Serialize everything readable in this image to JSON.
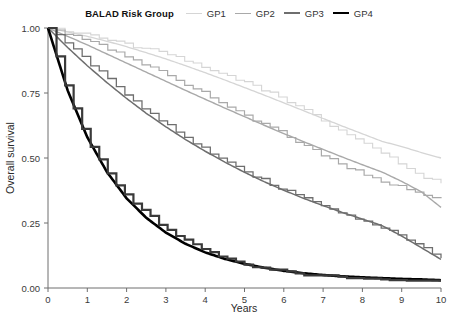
{
  "legend": {
    "title": "BALAD Risk Group",
    "entries": [
      {
        "label": "GP1",
        "color": "#d5d5d5",
        "width": 1.6
      },
      {
        "label": "GP2",
        "color": "#a9a9a9",
        "width": 1.8
      },
      {
        "label": "GP3",
        "color": "#6e6e6e",
        "width": 2.0
      },
      {
        "label": "GP4",
        "color": "#000000",
        "width": 2.8
      }
    ]
  },
  "axes": {
    "x_title": "Years",
    "y_title": "Overall survival",
    "x_ticks": [
      "0",
      "1",
      "2",
      "3",
      "4",
      "5",
      "6",
      "7",
      "8",
      "9",
      "10"
    ],
    "y_ticks": [
      "0.00",
      "0.25",
      "0.50",
      "0.75",
      "1.00"
    ]
  },
  "chart_data": {
    "type": "line",
    "title": "",
    "subtitle": "",
    "xlabel": "Years",
    "ylabel": "Overall survival",
    "xlim": [
      0,
      10
    ],
    "ylim": [
      0,
      1
    ],
    "xticks": [
      0,
      1,
      2,
      3,
      4,
      5,
      6,
      7,
      8,
      9,
      10
    ],
    "yticks": [
      0.0,
      0.25,
      0.5,
      0.75,
      1.0
    ],
    "grid": false,
    "legend_position": "top-center",
    "legend_title": "BALAD Risk Group",
    "x": [
      0,
      0.5,
      1,
      1.5,
      2,
      2.5,
      3,
      3.5,
      4,
      4.5,
      5,
      5.5,
      6,
      6.5,
      7,
      7.5,
      8,
      8.5,
      9,
      9.5,
      10
    ],
    "series": [
      {
        "name": "GP1",
        "kind": "smooth-fitted",
        "color": "#d5d5d5",
        "values": [
          1.0,
          0.985,
          0.968,
          0.949,
          0.928,
          0.905,
          0.881,
          0.855,
          0.828,
          0.8,
          0.771,
          0.742,
          0.712,
          0.682,
          0.652,
          0.622,
          0.593,
          0.564,
          0.544,
          0.521,
          0.5
        ]
      },
      {
        "name": "GP1",
        "kind": "kaplan-meier-step",
        "color": "#d5d5d5",
        "values": [
          1.0,
          0.988,
          0.975,
          0.958,
          0.935,
          0.918,
          0.9,
          0.872,
          0.84,
          0.82,
          0.79,
          0.76,
          0.72,
          0.69,
          0.64,
          0.6,
          0.56,
          0.52,
          0.47,
          0.43,
          0.4
        ]
      },
      {
        "name": "GP2",
        "kind": "smooth-fitted",
        "color": "#a9a9a9",
        "values": [
          1.0,
          0.968,
          0.935,
          0.9,
          0.865,
          0.83,
          0.795,
          0.76,
          0.726,
          0.692,
          0.659,
          0.626,
          0.594,
          0.563,
          0.533,
          0.503,
          0.474,
          0.446,
          0.41,
          0.37,
          0.31
        ]
      },
      {
        "name": "GP2",
        "kind": "kaplan-meier-step",
        "color": "#a9a9a9",
        "values": [
          1.0,
          0.975,
          0.95,
          0.92,
          0.89,
          0.855,
          0.82,
          0.78,
          0.745,
          0.705,
          0.665,
          0.625,
          0.59,
          0.55,
          0.51,
          0.47,
          0.44,
          0.41,
          0.385,
          0.36,
          0.34
        ]
      },
      {
        "name": "GP3",
        "kind": "smooth-fitted",
        "color": "#6e6e6e",
        "values": [
          1.0,
          0.925,
          0.855,
          0.79,
          0.729,
          0.672,
          0.62,
          0.571,
          0.526,
          0.484,
          0.445,
          0.409,
          0.376,
          0.345,
          0.317,
          0.29,
          0.265,
          0.24,
          0.2,
          0.155,
          0.11
        ]
      },
      {
        "name": "GP3",
        "kind": "kaplan-meier-step",
        "color": "#6e6e6e",
        "values": [
          1.0,
          0.935,
          0.87,
          0.805,
          0.74,
          0.68,
          0.63,
          0.58,
          0.53,
          0.49,
          0.45,
          0.41,
          0.375,
          0.345,
          0.31,
          0.285,
          0.26,
          0.23,
          0.195,
          0.16,
          0.115
        ]
      },
      {
        "name": "GP4",
        "kind": "smooth-fitted",
        "color": "#000000",
        "values": [
          1.0,
          0.76,
          0.58,
          0.446,
          0.345,
          0.27,
          0.213,
          0.17,
          0.137,
          0.112,
          0.093,
          0.078,
          0.066,
          0.057,
          0.05,
          0.045,
          0.041,
          0.038,
          0.035,
          0.033,
          0.03
        ]
      },
      {
        "name": "GP4",
        "kind": "kaplan-meier-step",
        "color": "#3a3a3a",
        "values": [
          1.0,
          0.745,
          0.565,
          0.44,
          0.35,
          0.285,
          0.228,
          0.18,
          0.14,
          0.11,
          0.09,
          0.076,
          0.064,
          0.055,
          0.048,
          0.043,
          0.039,
          0.036,
          0.034,
          0.032,
          0.03
        ]
      }
    ]
  }
}
